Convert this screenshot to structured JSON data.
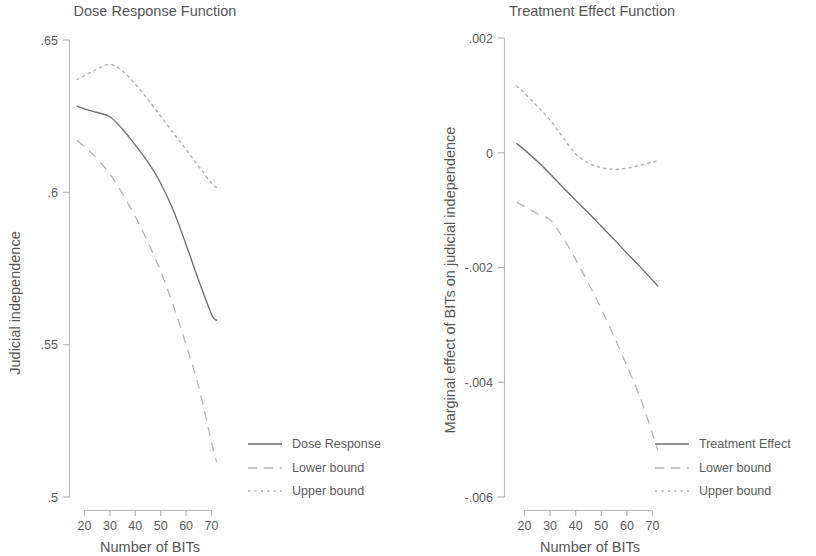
{
  "figure": {
    "background": "#ffffff",
    "line_color_solid": "#6f6f6f",
    "line_color_bound": "#b2b2b2",
    "text_color": "#555555",
    "axis_color": "#b9b9b9"
  },
  "chart_data": [
    {
      "type": "line",
      "panel": "left",
      "title": "Dose Response Function",
      "xlabel": "Number of BITs",
      "ylabel": "Judicial independence",
      "xlim": [
        15,
        75
      ],
      "ylim": [
        0.5,
        0.65
      ],
      "xticks": [
        20,
        30,
        40,
        50,
        60,
        70
      ],
      "xtick_labels": [
        "20",
        "30",
        "40",
        "50",
        "60",
        "70"
      ],
      "yticks": [
        0.5,
        0.55,
        0.6,
        0.65
      ],
      "ytick_labels": [
        ".5",
        ".55",
        ".6",
        ".65"
      ],
      "grid": false,
      "legend_position": "lower right",
      "x": [
        17,
        20,
        25,
        30,
        35,
        40,
        45,
        50,
        55,
        60,
        65,
        70,
        72
      ],
      "series": [
        {
          "name": "Dose Response",
          "style": "solid",
          "values": [
            0.6283,
            0.6274,
            0.6262,
            0.6248,
            0.6207,
            0.6155,
            0.6099,
            0.603,
            0.594,
            0.5828,
            0.571,
            0.56,
            0.558
          ]
        },
        {
          "name": "Lower bound",
          "style": "dashed",
          "values": [
            0.617,
            0.615,
            0.611,
            0.606,
            0.5995,
            0.592,
            0.5836,
            0.574,
            0.5628,
            0.55,
            0.536,
            0.518,
            0.5115
          ]
        },
        {
          "name": "Upper bound",
          "style": "dotted",
          "values": [
            0.637,
            0.6383,
            0.6405,
            0.642,
            0.6398,
            0.6355,
            0.6305,
            0.625,
            0.6195,
            0.614,
            0.6085,
            0.603,
            0.6015
          ]
        }
      ]
    },
    {
      "type": "line",
      "panel": "right",
      "title": "Treatment Effect Function",
      "xlabel": "Number of BITs",
      "ylabel": "Marginal effect of BITs on judicial independence",
      "xlim": [
        15,
        75
      ],
      "ylim": [
        -0.006,
        0.002
      ],
      "xticks": [
        20,
        30,
        40,
        50,
        60,
        70
      ],
      "xtick_labels": [
        "20",
        "30",
        "40",
        "50",
        "60",
        "70"
      ],
      "yticks": [
        -0.006,
        -0.004,
        -0.002,
        0
      ],
      "ytick_labels": [
        "-.006",
        "-.004",
        "-.002",
        "0"
      ],
      "grid": false,
      "legend_position": "lower right",
      "x": [
        17,
        20,
        25,
        30,
        35,
        40,
        45,
        50,
        55,
        60,
        65,
        70,
        72
      ],
      "series": [
        {
          "name": "Treatment Effect",
          "style": "solid",
          "values": [
            0.00016,
            5e-05,
            -0.00015,
            -0.00037,
            -0.0006,
            -0.00083,
            -0.00105,
            -0.00128,
            -0.00151,
            -0.00175,
            -0.00198,
            -0.00222,
            -0.00232
          ]
        },
        {
          "name": "Lower bound",
          "style": "dashed",
          "values": [
            -0.00086,
            -0.00094,
            -0.00106,
            -0.00117,
            -0.00148,
            -0.00186,
            -0.00228,
            -0.00272,
            -0.0032,
            -0.00372,
            -0.00424,
            -0.0049,
            -0.00518
          ]
        },
        {
          "name": "Upper bound",
          "style": "dotted",
          "values": [
            0.00116,
            0.00104,
            0.00081,
            0.00057,
            0.00027,
            -2e-05,
            -0.00018,
            -0.00026,
            -0.00029,
            -0.00027,
            -0.00022,
            -0.00016,
            -0.00014
          ]
        }
      ]
    }
  ],
  "left_panel": {
    "title": "Dose Response Function",
    "y_axis_title": "Judicial independence",
    "x_axis_title": "Number of BITs",
    "y_ticks": [
      ".65",
      ".6",
      ".55",
      ".5"
    ],
    "x_ticks": [
      "20",
      "30",
      "40",
      "50",
      "60",
      "70"
    ],
    "legend": [
      {
        "label": "Dose Response",
        "style": "solid"
      },
      {
        "label": "Lower bound",
        "style": "dashed"
      },
      {
        "label": "Upper bound",
        "style": "dotted"
      }
    ]
  },
  "right_panel": {
    "title": "Treatment Effect Function",
    "y_axis_title": "Marginal effect of BITs on judicial independence",
    "x_axis_title": "Number of BITs",
    "y_ticks": [
      ".002",
      "0",
      "-.002",
      "-.004",
      "-.006"
    ],
    "x_ticks": [
      "20",
      "30",
      "40",
      "50",
      "60",
      "70"
    ],
    "legend": [
      {
        "label": "Treatment Effect",
        "style": "solid"
      },
      {
        "label": "Lower bound",
        "style": "dashed"
      },
      {
        "label": "Upper bound",
        "style": "dotted"
      }
    ]
  }
}
